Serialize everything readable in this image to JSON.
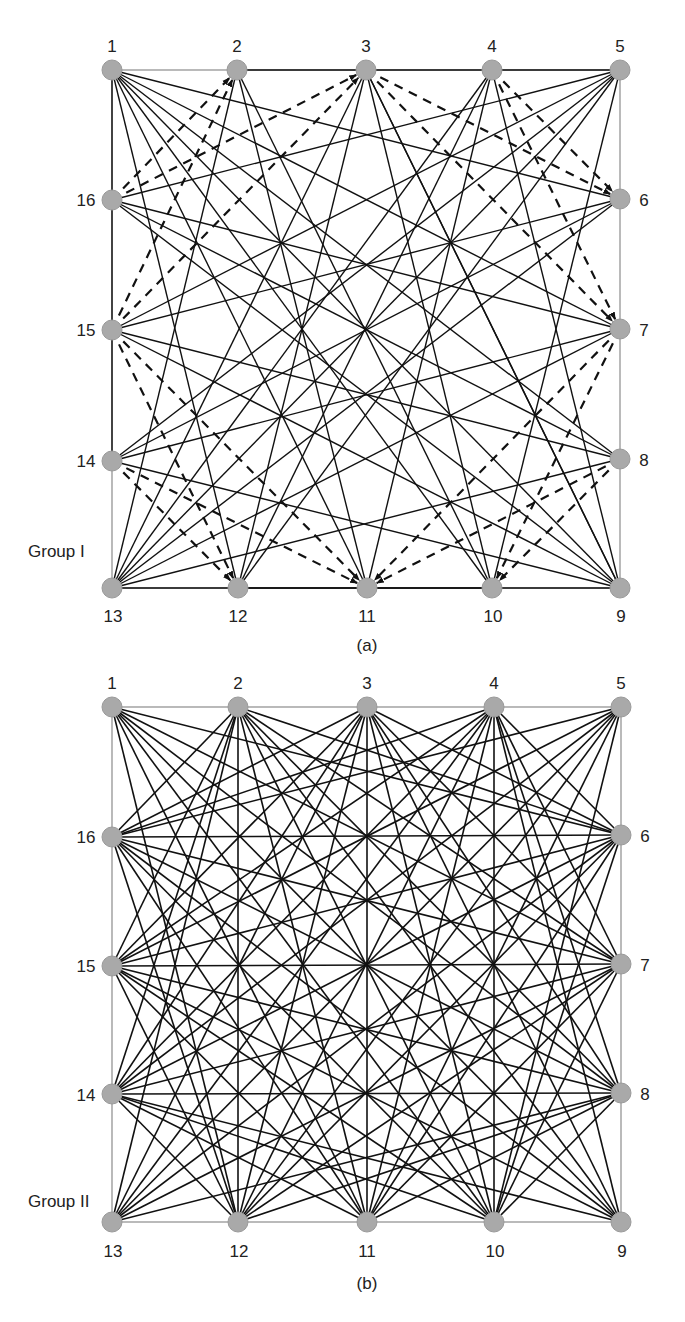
{
  "style": {
    "node_fill": "#a9a9a9",
    "node_stroke": "#9a9a9a",
    "edge_color": "#111111",
    "border_color": "#8c8c8c",
    "node_radius": 10
  },
  "figures": [
    {
      "id": "a",
      "caption": "(a)",
      "group_label": "Group I",
      "caption_pos": [
        367,
        645
      ],
      "group_label_pos": [
        28,
        543
      ],
      "nodes": [
        {
          "id": 1,
          "label": "1",
          "x": 112,
          "y": 70,
          "lx": 112,
          "ly": 46
        },
        {
          "id": 2,
          "label": "2",
          "x": 237,
          "y": 70,
          "lx": 237,
          "ly": 46
        },
        {
          "id": 3,
          "label": "3",
          "x": 366,
          "y": 70,
          "lx": 366,
          "ly": 46
        },
        {
          "id": 4,
          "label": "4",
          "x": 492,
          "y": 70,
          "lx": 492,
          "ly": 46
        },
        {
          "id": 5,
          "label": "5",
          "x": 620,
          "y": 70,
          "lx": 620,
          "ly": 46
        },
        {
          "id": 6,
          "label": "6",
          "x": 620,
          "y": 199,
          "lx": 644,
          "ly": 200
        },
        {
          "id": 7,
          "label": "7",
          "x": 620,
          "y": 329,
          "lx": 644,
          "ly": 330
        },
        {
          "id": 8,
          "label": "8",
          "x": 620,
          "y": 459,
          "lx": 644,
          "ly": 460
        },
        {
          "id": 9,
          "label": "9",
          "x": 620,
          "y": 588,
          "lx": 621,
          "ly": 616
        },
        {
          "id": 10,
          "label": "10",
          "x": 492,
          "y": 588,
          "lx": 493,
          "ly": 616
        },
        {
          "id": 11,
          "label": "11",
          "x": 367,
          "y": 588,
          "lx": 367,
          "ly": 616
        },
        {
          "id": 12,
          "label": "12",
          "x": 238,
          "y": 588,
          "lx": 238,
          "ly": 616
        },
        {
          "id": 13,
          "label": "13",
          "x": 112,
          "y": 588,
          "lx": 113,
          "ly": 616
        },
        {
          "id": 14,
          "label": "14",
          "x": 112,
          "y": 461,
          "lx": 86,
          "ly": 461
        },
        {
          "id": 15,
          "label": "15",
          "x": 112,
          "y": 330,
          "lx": 86,
          "ly": 330
        },
        {
          "id": 16,
          "label": "16",
          "x": 112,
          "y": 200,
          "lx": 86,
          "ly": 200
        }
      ],
      "solid_edges": [
        [
          1,
          6
        ],
        [
          1,
          7
        ],
        [
          1,
          8
        ],
        [
          1,
          10
        ],
        [
          1,
          11
        ],
        [
          1,
          12
        ],
        [
          1,
          14
        ],
        [
          5,
          2
        ],
        [
          5,
          16
        ],
        [
          5,
          15
        ],
        [
          5,
          14
        ],
        [
          5,
          13
        ],
        [
          5,
          12
        ],
        [
          5,
          10
        ],
        [
          9,
          4
        ],
        [
          9,
          3
        ],
        [
          9,
          1
        ],
        [
          9,
          16
        ],
        [
          9,
          15
        ],
        [
          9,
          14
        ],
        [
          9,
          12
        ],
        [
          13,
          2
        ],
        [
          13,
          3
        ],
        [
          13,
          4
        ],
        [
          13,
          6
        ],
        [
          13,
          7
        ],
        [
          13,
          8
        ],
        [
          13,
          10
        ],
        [
          2,
          10
        ],
        [
          3,
          12
        ],
        [
          3,
          10
        ],
        [
          4,
          12
        ],
        [
          4,
          11
        ],
        [
          16,
          8
        ],
        [
          16,
          7
        ],
        [
          15,
          6
        ],
        [
          15,
          8
        ],
        [
          14,
          6
        ],
        [
          14,
          7
        ],
        [
          2,
          11
        ],
        [
          3,
          9
        ]
      ],
      "dashed_edges": [
        [
          16,
          2
        ],
        [
          16,
          3
        ],
        [
          15,
          2
        ],
        [
          15,
          3
        ],
        [
          3,
          6
        ],
        [
          3,
          7
        ],
        [
          4,
          6
        ],
        [
          4,
          7
        ],
        [
          7,
          10
        ],
        [
          7,
          11
        ],
        [
          8,
          10
        ],
        [
          8,
          11
        ],
        [
          14,
          11
        ],
        [
          14,
          12
        ],
        [
          15,
          11
        ],
        [
          15,
          12
        ]
      ],
      "border": [
        112,
        70,
        620,
        588
      ]
    },
    {
      "id": "b",
      "caption": "(b)",
      "group_label": "Group II",
      "caption_pos": [
        367,
        623
      ],
      "group_label_pos": [
        28,
        533
      ],
      "nodes": [
        {
          "id": 1,
          "label": "1",
          "x": 112,
          "y": 47,
          "lx": 112,
          "ly": 23
        },
        {
          "id": 2,
          "label": "2",
          "x": 238,
          "y": 47,
          "lx": 238,
          "ly": 23
        },
        {
          "id": 3,
          "label": "3",
          "x": 367,
          "y": 47,
          "lx": 367,
          "ly": 23
        },
        {
          "id": 4,
          "label": "4",
          "x": 494,
          "y": 47,
          "lx": 494,
          "ly": 23
        },
        {
          "id": 5,
          "label": "5",
          "x": 621,
          "y": 47,
          "lx": 621,
          "ly": 23
        },
        {
          "id": 6,
          "label": "6",
          "x": 621,
          "y": 175,
          "lx": 645,
          "ly": 176
        },
        {
          "id": 7,
          "label": "7",
          "x": 621,
          "y": 304,
          "lx": 645,
          "ly": 305
        },
        {
          "id": 8,
          "label": "8",
          "x": 621,
          "y": 433,
          "lx": 645,
          "ly": 434
        },
        {
          "id": 9,
          "label": "9",
          "x": 621,
          "y": 562,
          "lx": 622,
          "ly": 591
        },
        {
          "id": 10,
          "label": "10",
          "x": 494,
          "y": 562,
          "lx": 495,
          "ly": 591
        },
        {
          "id": 11,
          "label": "11",
          "x": 367,
          "y": 562,
          "lx": 367,
          "ly": 591
        },
        {
          "id": 12,
          "label": "12",
          "x": 238,
          "y": 562,
          "lx": 239,
          "ly": 591
        },
        {
          "id": 13,
          "label": "13",
          "x": 112,
          "y": 562,
          "lx": 113,
          "ly": 591
        },
        {
          "id": 14,
          "label": "14",
          "x": 112,
          "y": 434,
          "lx": 86,
          "ly": 435
        },
        {
          "id": 15,
          "label": "15",
          "x": 112,
          "y": 306,
          "lx": 86,
          "ly": 306
        },
        {
          "id": 16,
          "label": "16",
          "x": 112,
          "y": 177,
          "lx": 86,
          "ly": 177
        }
      ],
      "edge_rule": "connect every pair of nodes not sharing a square side",
      "sides": [
        [
          1,
          2,
          3,
          4,
          5
        ],
        [
          5,
          6,
          7,
          8,
          9
        ],
        [
          9,
          10,
          11,
          12,
          13
        ],
        [
          13,
          14,
          15,
          16,
          1
        ]
      ],
      "border": [
        112,
        47,
        621,
        562
      ]
    }
  ]
}
